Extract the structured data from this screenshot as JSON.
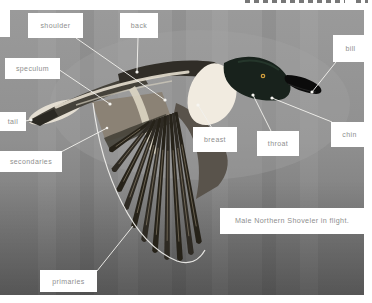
{
  "figure": {
    "caption": "Male Northern Shoveler in flight."
  },
  "labels": {
    "shoulder": "shoulder",
    "back": "back",
    "bill": "bill",
    "speculum": "speculum",
    "tail": "tail",
    "secondaries": "secondaries",
    "breast": "breast",
    "throat": "throat",
    "chin": "chin",
    "primaries": "primaries"
  },
  "colors": {
    "label_text": "#8e8e8e",
    "label_box": "#ffffff",
    "leader_line": "#f3f2ee",
    "photo_background_top": "#9a9a9a",
    "photo_background_bottom": "#6e6e6e"
  }
}
